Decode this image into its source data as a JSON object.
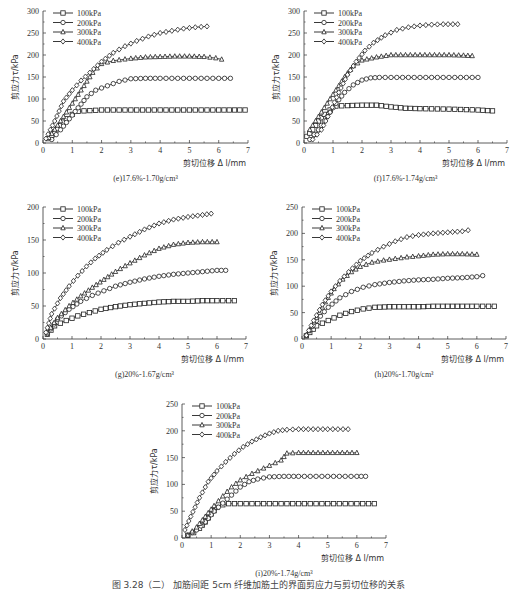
{
  "figure_caption": "图 3.28（二） 加筋间距 5cm 纤维加筋土的界面剪应力与剪切位移的关系",
  "chart_data": [
    {
      "id": "e",
      "type": "line",
      "title": "(e)17.6%-1.70g/cm³",
      "xlabel": "剪切位移 Δl/mm",
      "ylabel": "剪应力 τ/kPa",
      "xlim": [
        0,
        7
      ],
      "ylim": [
        0,
        300
      ],
      "xticks": [
        0,
        1,
        2,
        3,
        4,
        5,
        6,
        7
      ],
      "yticks": [
        0,
        50,
        100,
        150,
        200,
        250,
        300
      ],
      "grid": false,
      "legend_position": "upper left",
      "series": [
        {
          "name": "100kPa",
          "marker": "square",
          "x": [
            0.2,
            0.4,
            0.6,
            0.8,
            1.0,
            1.2,
            1.4,
            2.0,
            3.0,
            4.0,
            5.0,
            6.0,
            6.9
          ],
          "y": [
            10,
            25,
            40,
            55,
            65,
            72,
            73,
            75,
            75,
            75,
            75,
            75,
            75
          ]
        },
        {
          "name": "200kPa",
          "marker": "circle",
          "x": [
            0.3,
            0.6,
            0.9,
            1.2,
            1.5,
            1.8,
            2.2,
            2.6,
            3.0,
            3.5,
            4.0,
            5.0,
            6.0,
            6.4
          ],
          "y": [
            8,
            30,
            55,
            80,
            105,
            120,
            130,
            140,
            146,
            147,
            147,
            147,
            147,
            147
          ]
        },
        {
          "name": "300kPa",
          "marker": "triangle",
          "x": [
            0.2,
            0.5,
            0.8,
            1.1,
            1.4,
            1.7,
            2.0,
            2.4,
            3.0,
            3.5,
            4.0,
            4.5,
            5.0,
            5.5,
            5.9,
            6.1
          ],
          "y": [
            12,
            40,
            70,
            100,
            130,
            160,
            180,
            187,
            192,
            195,
            196,
            197,
            197,
            196,
            193,
            190
          ]
        },
        {
          "name": "400kPa",
          "marker": "diamond",
          "x": [
            0.1,
            0.4,
            0.7,
            1.0,
            1.3,
            1.6,
            2.0,
            2.4,
            2.8,
            3.2,
            3.6,
            4.0,
            4.4,
            4.8,
            5.2,
            5.6
          ],
          "y": [
            10,
            50,
            95,
            120,
            142,
            160,
            185,
            205,
            220,
            232,
            242,
            250,
            255,
            260,
            263,
            265
          ]
        }
      ]
    },
    {
      "id": "f",
      "type": "line",
      "title": "(f)17.6%-1.74g/cm³",
      "xlabel": "剪切位移 Δl/mm",
      "ylabel": "剪应力 τ/kPa",
      "xlim": [
        0,
        7
      ],
      "ylim": [
        0,
        300
      ],
      "xticks": [
        0,
        1,
        2,
        3,
        4,
        5,
        6,
        7
      ],
      "yticks": [
        0,
        50,
        100,
        150,
        200,
        250,
        300
      ],
      "grid": false,
      "legend_position": "upper left",
      "series": [
        {
          "name": "100kPa",
          "marker": "square",
          "x": [
            0.1,
            0.3,
            0.5,
            0.7,
            0.9,
            1.1,
            1.5,
            2.0,
            2.5,
            3.0,
            3.5,
            4.0,
            5.0,
            6.0,
            6.5
          ],
          "y": [
            15,
            30,
            50,
            65,
            75,
            84,
            85,
            86,
            86,
            82,
            79,
            78,
            77,
            75,
            73
          ]
        },
        {
          "name": "200kPa",
          "marker": "circle",
          "x": [
            0.2,
            0.5,
            0.8,
            1.1,
            1.4,
            1.7,
            2.0,
            2.3,
            2.6,
            3.0,
            4.0,
            5.0,
            6.0
          ],
          "y": [
            8,
            30,
            60,
            90,
            115,
            132,
            143,
            148,
            149,
            149,
            149,
            149,
            149
          ]
        },
        {
          "name": "300kPa",
          "marker": "triangle",
          "x": [
            0.2,
            0.5,
            0.8,
            1.1,
            1.4,
            1.7,
            2.0,
            2.5,
            3.0,
            3.5,
            4.0,
            4.5,
            5.0,
            5.5,
            5.8
          ],
          "y": [
            30,
            60,
            90,
            120,
            150,
            175,
            188,
            195,
            200,
            200,
            200,
            200,
            200,
            199,
            198
          ]
        },
        {
          "name": "400kPa",
          "marker": "diamond",
          "x": [
            0.3,
            0.6,
            0.9,
            1.2,
            1.5,
            1.8,
            2.1,
            2.4,
            2.8,
            3.2,
            3.6,
            4.0,
            4.4,
            4.8,
            5.3
          ],
          "y": [
            8,
            30,
            70,
            115,
            155,
            185,
            210,
            228,
            245,
            257,
            263,
            267,
            269,
            270,
            270
          ]
        }
      ]
    },
    {
      "id": "g",
      "type": "line",
      "title": "(g)20%-1.67g/cm³",
      "xlabel": "剪切位移 Δl/mm",
      "ylabel": "剪应力 τ/kPa",
      "xlim": [
        0,
        7
      ],
      "ylim": [
        0,
        200
      ],
      "xticks": [
        0,
        1,
        2,
        3,
        4,
        5,
        6,
        7
      ],
      "yticks": [
        0,
        50,
        100,
        150,
        200
      ],
      "grid": false,
      "legend_position": "upper left",
      "series": [
        {
          "name": "100kPa",
          "marker": "square",
          "x": [
            0.15,
            0.4,
            0.8,
            1.2,
            1.6,
            2.0,
            2.5,
            3.0,
            3.5,
            4.0,
            4.5,
            5.0,
            5.5,
            6.0,
            6.6
          ],
          "y": [
            7,
            20,
            28,
            35,
            40,
            45,
            49,
            52,
            54,
            56,
            57,
            57,
            58,
            58,
            58
          ]
        },
        {
          "name": "200kPa",
          "marker": "circle",
          "x": [
            0.15,
            0.5,
            0.9,
            1.3,
            1.7,
            2.1,
            2.5,
            3.0,
            3.5,
            4.0,
            4.5,
            5.0,
            5.5,
            6.0,
            6.3
          ],
          "y": [
            8,
            30,
            45,
            57,
            66,
            73,
            80,
            86,
            91,
            95,
            98,
            100,
            102,
            104,
            104
          ]
        },
        {
          "name": "300kPa",
          "marker": "triangle",
          "x": [
            0.15,
            0.5,
            0.9,
            1.3,
            1.7,
            2.1,
            2.5,
            3.0,
            3.5,
            4.0,
            4.5,
            5.0,
            5.5,
            6.0
          ],
          "y": [
            10,
            32,
            50,
            65,
            78,
            90,
            102,
            115,
            127,
            137,
            143,
            146,
            147,
            147
          ]
        },
        {
          "name": "400kPa",
          "marker": "diamond",
          "x": [
            0.1,
            0.3,
            0.6,
            0.9,
            1.2,
            1.5,
            1.8,
            2.2,
            2.6,
            3.0,
            3.5,
            4.0,
            4.5,
            5.0,
            5.5,
            5.8
          ],
          "y": [
            10,
            38,
            62,
            80,
            96,
            110,
            122,
            135,
            146,
            155,
            166,
            175,
            181,
            185,
            188,
            190
          ]
        }
      ]
    },
    {
      "id": "h",
      "type": "line",
      "title": "(h)20%-1.70g/cm³",
      "xlabel": "剪切位移 Δl/mm",
      "ylabel": "剪应力 τ/kPa",
      "xlim": [
        0,
        7
      ],
      "ylim": [
        0,
        250
      ],
      "xticks": [
        0,
        1,
        2,
        3,
        4,
        5,
        6,
        7
      ],
      "yticks": [
        0,
        50,
        100,
        150,
        200,
        250
      ],
      "grid": false,
      "legend_position": "upper left",
      "series": [
        {
          "name": "100kPa",
          "marker": "square",
          "x": [
            0.15,
            0.5,
            0.9,
            1.3,
            1.7,
            2.1,
            2.5,
            3.0,
            3.5,
            4.0,
            4.5,
            5.0,
            5.5,
            6.0,
            6.6
          ],
          "y": [
            6,
            25,
            35,
            45,
            52,
            57,
            60,
            61,
            61,
            61,
            62,
            62,
            62,
            62,
            62
          ]
        },
        {
          "name": "200kPa",
          "marker": "circle",
          "x": [
            0.15,
            0.5,
            0.9,
            1.3,
            1.7,
            2.1,
            2.5,
            3.0,
            3.5,
            4.0,
            4.5,
            5.0,
            5.5,
            6.0,
            6.2
          ],
          "y": [
            7,
            35,
            60,
            78,
            90,
            98,
            103,
            107,
            110,
            112,
            113,
            115,
            116,
            118,
            120
          ]
        },
        {
          "name": "300kPa",
          "marker": "triangle",
          "x": [
            0.15,
            0.5,
            0.8,
            1.1,
            1.4,
            1.7,
            2.0,
            2.4,
            2.8,
            3.2,
            3.6,
            4.0,
            4.5,
            5.0,
            5.5,
            6.0
          ],
          "y": [
            7,
            40,
            70,
            95,
            113,
            127,
            137,
            145,
            149,
            152,
            155,
            157,
            160,
            161,
            161,
            160
          ]
        },
        {
          "name": "400kPa",
          "marker": "diamond",
          "x": [
            0.15,
            0.4,
            0.7,
            1.0,
            1.3,
            1.6,
            2.0,
            2.4,
            2.8,
            3.2,
            3.6,
            4.0,
            4.5,
            5.0,
            5.5,
            5.7
          ],
          "y": [
            7,
            35,
            65,
            90,
            110,
            127,
            148,
            163,
            175,
            185,
            193,
            197,
            200,
            202,
            204,
            206
          ]
        }
      ]
    },
    {
      "id": "i",
      "type": "line",
      "title": "(i)20%-1.74g/cm³",
      "xlabel": "剪切位移 Δl/mm",
      "ylabel": "剪应力 τ/kPa",
      "xlim": [
        0,
        7
      ],
      "ylim": [
        0,
        250
      ],
      "xticks": [
        0,
        1,
        2,
        3,
        4,
        5,
        6,
        7
      ],
      "yticks": [
        0,
        50,
        100,
        150,
        200,
        250
      ],
      "grid": false,
      "legend_position": "upper left",
      "series": [
        {
          "name": "100kPa",
          "marker": "square",
          "x": [
            0.2,
            0.4,
            0.6,
            0.8,
            1.0,
            1.2,
            1.4,
            1.6,
            2.0,
            3.0,
            4.0,
            5.0,
            6.0,
            6.6
          ],
          "y": [
            5,
            10,
            18,
            30,
            45,
            57,
            62,
            64,
            64,
            64,
            64,
            64,
            64,
            64
          ]
        },
        {
          "name": "200kPa",
          "marker": "circle",
          "x": [
            0.2,
            0.5,
            0.8,
            1.1,
            1.4,
            1.7,
            2.0,
            2.3,
            2.6,
            3.0,
            3.5,
            4.0,
            5.0,
            6.0,
            6.3
          ],
          "y": [
            5,
            15,
            30,
            50,
            65,
            80,
            95,
            105,
            110,
            114,
            115,
            115,
            115,
            115,
            115
          ]
        },
        {
          "name": "300kPa",
          "marker": "triangle",
          "x": [
            0.2,
            0.5,
            0.8,
            1.1,
            1.4,
            1.7,
            2.0,
            2.4,
            2.8,
            3.2,
            3.4,
            3.6,
            4.0,
            4.5,
            5.0,
            5.5,
            6.0
          ],
          "y": [
            5,
            20,
            40,
            60,
            78,
            95,
            108,
            120,
            130,
            140,
            145,
            158,
            159,
            159,
            159,
            159,
            159
          ]
        },
        {
          "name": "400kPa",
          "marker": "diamond",
          "x": [
            0.1,
            0.3,
            0.6,
            0.9,
            1.2,
            1.5,
            1.8,
            2.1,
            2.4,
            2.7,
            3.0,
            3.3,
            3.6,
            4.0,
            4.5,
            5.0,
            5.7
          ],
          "y": [
            15,
            40,
            75,
            105,
            125,
            142,
            157,
            170,
            180,
            188,
            195,
            200,
            202,
            203,
            203,
            203,
            203
          ]
        }
      ]
    }
  ],
  "panels": {
    "e": {
      "title": "(e)17.6%-1.70g/cm³",
      "xlabel": "剪切位移 Δ l/mm",
      "ylabel": "剪应力τ/kPa"
    },
    "f": {
      "title": "(f)17.6%-1.74g/cm³",
      "xlabel": "剪切位移 Δ l/mm",
      "ylabel": "剪应力τ/kPa"
    },
    "g": {
      "title": "(g)20%-1.67g/cm³",
      "xlabel": "剪切位移 Δ l/mm",
      "ylabel": "剪应力τ/kPa"
    },
    "h": {
      "title": "(h)20%-1.70g/cm³",
      "xlabel": "剪切位移 Δ l/mm",
      "ylabel": "剪应力τ/kPa"
    },
    "i": {
      "title": "(i)20%-1.74g/cm³",
      "xlabel": "剪切位移 Δ l/mm",
      "ylabel": "剪应力τ/kPa"
    }
  },
  "legend": [
    "100kPa",
    "200kPa",
    "300kPa",
    "400kPa"
  ],
  "colors": {
    "line": "#222222",
    "axis": "#333333",
    "background": "#ffffff"
  }
}
